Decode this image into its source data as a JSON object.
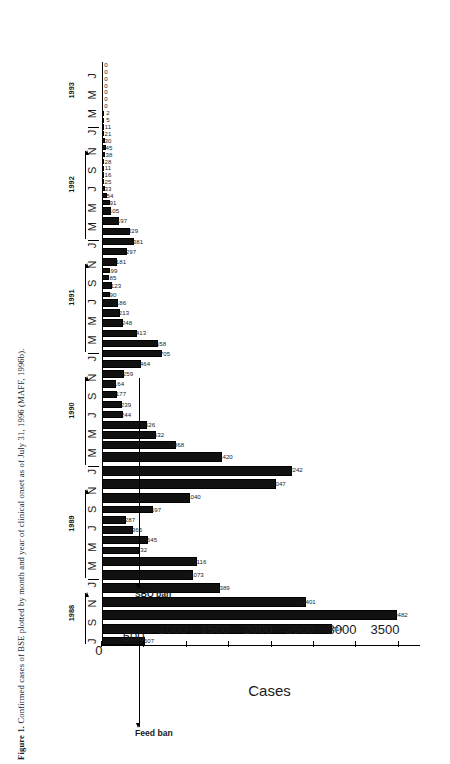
{
  "figure": {
    "caption_label": "Figure 1.",
    "caption_text": " Confirmed cases of BSE plotted by month and year of clinical onset as of July 31, 1996 (MAFF, 1996b).",
    "caption_full": "Figure 1. Confirmed cases of BSE plotted by month and year of clinical onset as of July 31, 1996 (MAFF, 1996b)."
  },
  "annotations": [
    {
      "name": "feed-ban",
      "label": "Feed ban",
      "at_category": "1988-07"
    },
    {
      "name": "sbo-ban",
      "label": "SBO ban",
      "at_category": "1990-11"
    }
  ],
  "colors": {
    "bar": "#111111",
    "axis": "#000000",
    "text": "#1a1a1a",
    "background": "#ffffff"
  },
  "chart_data": {
    "type": "bar",
    "title": "",
    "subtitle": "",
    "xlabel": "",
    "ylabel": "Cases",
    "ylim": [
      0,
      3750
    ],
    "yticks": [
      0,
      500,
      1000,
      1500,
      2000,
      2500,
      3000,
      3500
    ],
    "ytick_labels": [
      "0",
      "500",
      "1000",
      "1500",
      "2000",
      "2500",
      "3000",
      "3500"
    ],
    "grid": false,
    "legend": "none",
    "orientation": "rotated-90",
    "year_groups": [
      {
        "year": "1988",
        "count": 7
      },
      {
        "year": "1989",
        "count": 12
      },
      {
        "year": "1990",
        "count": 12
      },
      {
        "year": "1991",
        "count": 12
      },
      {
        "year": "1992",
        "count": 12
      },
      {
        "year": "1993",
        "count": 8
      }
    ],
    "month_ticks": [
      "J",
      "",
      "S",
      "",
      "N",
      "",
      "J",
      "",
      "M",
      "",
      "M",
      "",
      "J",
      "",
      "S",
      "",
      "N",
      "",
      "J",
      "",
      "M",
      "",
      "M",
      "",
      "J",
      "",
      "S",
      "",
      "N",
      "",
      "J",
      "",
      "M",
      "",
      "M",
      "",
      "J",
      "",
      "S",
      "",
      "N",
      "",
      "J",
      "",
      "M",
      "",
      "M",
      "",
      "J",
      "",
      "S",
      "",
      "N",
      "",
      "J",
      "",
      "M",
      "",
      "M",
      "",
      "J",
      "",
      "S",
      "",
      "N"
    ],
    "categories": [
      "1988-J",
      "1988-A",
      "1988-S",
      "1988-O",
      "1988-N",
      "1988-D",
      "1989-J",
      "1989-F",
      "1989-M",
      "1989-A",
      "1989-M",
      "1989-J",
      "1989-J",
      "1989-A",
      "1989-S",
      "1989-O",
      "1989-N",
      "1989-D",
      "1990-J",
      "1990-F",
      "1990-M",
      "1990-A",
      "1990-M",
      "1990-J",
      "1990-J",
      "1990-A",
      "1990-S",
      "1990-O",
      "1990-N",
      "1990-D",
      "1991-J",
      "1991-F",
      "1991-M",
      "1991-A",
      "1991-M",
      "1991-J",
      "1991-J",
      "1991-A",
      "1991-S",
      "1991-O",
      "1991-N",
      "1991-D",
      "1992-J",
      "1992-F",
      "1992-M",
      "1992-A",
      "1992-M",
      "1992-J",
      "1992-J",
      "1992-A",
      "1992-S",
      "1992-O",
      "1992-N",
      "1992-D",
      "1993-J",
      "1993-F",
      "1993-M",
      "1993-A",
      "1993-M",
      "1993-J",
      "1993-J",
      "1993-A"
    ],
    "values": [
      507,
      2714,
      3482,
      2401,
      1389,
      1073,
      1116,
      432,
      545,
      365,
      287,
      597,
      1040,
      2047,
      2242,
      1420,
      868,
      632,
      526,
      244,
      239,
      177,
      164,
      259,
      464,
      705,
      658,
      413,
      248,
      213,
      186,
      90,
      123,
      85,
      99,
      181,
      297,
      381,
      329,
      197,
      105,
      91,
      54,
      33,
      25,
      16,
      11,
      28,
      38,
      45,
      30,
      21,
      11,
      5,
      2,
      0,
      0,
      0,
      0,
      0,
      0,
      0
    ],
    "value_labels": [
      "507",
      "2714",
      "3482",
      "2401",
      "1389",
      "1073",
      "1116",
      "432",
      "545",
      "365",
      "287",
      "597",
      "1040",
      "2047",
      "2242",
      "1420",
      "868",
      "632",
      "526",
      "244",
      "239",
      "177",
      "164",
      "259",
      "464",
      "705",
      "658",
      "413",
      "248",
      "213",
      "186",
      "90",
      "123",
      "85",
      "99",
      "181",
      "297",
      "381",
      "329",
      "197",
      "105",
      "91",
      "54",
      "33",
      "25",
      "16",
      "11",
      "28",
      "38",
      "45",
      "30",
      "21",
      "11",
      "5",
      "2",
      "0",
      "0",
      "0",
      "0",
      "0",
      "0",
      "0"
    ]
  }
}
